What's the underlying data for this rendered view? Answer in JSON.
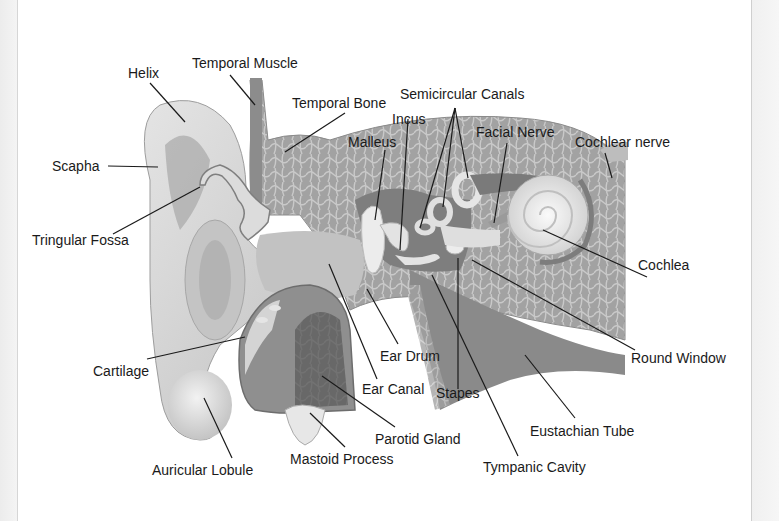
{
  "diagram": {
    "labels": {
      "helix": "Helix",
      "temporal_muscle": "Temporal Muscle",
      "temporal_bone": "Temporal Bone",
      "semicircular_canals": "Semicircular Canals",
      "incus": "Incus",
      "malleus": "Malleus",
      "facial_nerve": "Facial Nerve",
      "cochlear_nerve": "Cochlear nerve",
      "scapha": "Scapha",
      "tringular_fossa": "Tringular Fossa",
      "cochlea": "Cochlea",
      "round_window": "Round Window",
      "cartilage": "Cartilage",
      "ear_drum": "Ear Drum",
      "ear_canal": "Ear Canal",
      "stapes": "Stapes",
      "eustachian_tube": "Eustachian Tube",
      "parotid_gland": "Parotid Gland",
      "mastoid_process": "Mastoid Process",
      "tympanic_cavity": "Tympanic Cavity",
      "auricular_lobule": "Auricular Lobule"
    },
    "colors": {
      "bone_fill": "#9a9a9a",
      "bone_light": "#bdbdbd",
      "skin_light": "#d8d8d8",
      "skin_mid": "#b8b8b8",
      "dark": "#6e6e6e",
      "leader_line": "#1a1a1a"
    }
  }
}
